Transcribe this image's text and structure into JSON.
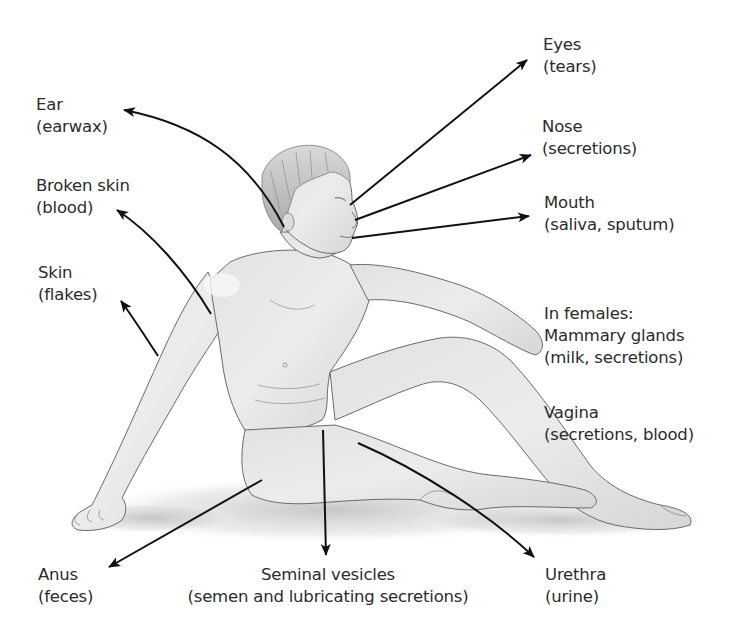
{
  "colors": {
    "text": "#2b2b2b",
    "arrow": "#111111",
    "skin_light": "#ededed",
    "skin_mid": "#d4d4d4",
    "outline": "#6a6a6a",
    "shadow": "#cfcfcf",
    "hair": "#bdbdbd"
  },
  "labels": {
    "ear": {
      "title": "Ear",
      "detail": "(earwax)"
    },
    "broken_skin": {
      "title": "Broken skin",
      "detail": "(blood)"
    },
    "skin": {
      "title": "Skin",
      "detail": "(flakes)"
    },
    "eyes": {
      "title": "Eyes",
      "detail": "(tears)"
    },
    "nose": {
      "title": "Nose",
      "detail": "(secretions)"
    },
    "mouth": {
      "title": "Mouth",
      "detail": "(saliva, sputum)"
    },
    "females": {
      "title": "In females:",
      "subtitle": "Mammary glands",
      "detail": "(milk, secretions)"
    },
    "vagina": {
      "title": "Vagina",
      "detail": "(secretions, blood)"
    },
    "anus": {
      "title": "Anus",
      "detail": "(feces)"
    },
    "seminal": {
      "title": "Seminal vesicles",
      "detail": "(semen and lubricating secretions)"
    },
    "urethra": {
      "title": "Urethra",
      "detail": "(urine)"
    }
  }
}
